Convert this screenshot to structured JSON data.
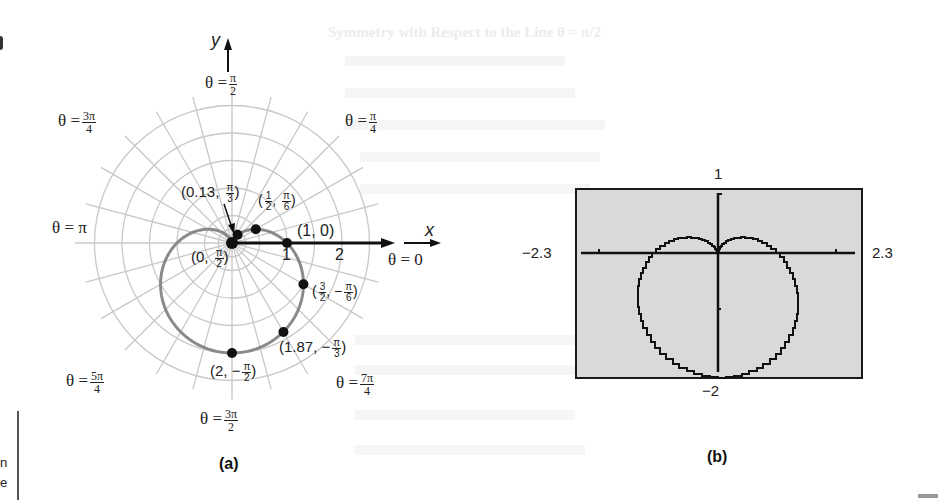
{
  "chart_data": [
    {
      "id": "a",
      "type": "line",
      "subtype": "polar",
      "title": "",
      "caption": "(a)",
      "equation": "r = 1 - sin(theta)",
      "axes": {
        "x_label": "x",
        "y_label": "y",
        "polar_axis_ticks": [
          "1",
          "2"
        ]
      },
      "angle_labels": [
        {
          "theta": "0",
          "text": "θ = 0"
        },
        {
          "theta": "π/4",
          "text": "θ = π/4"
        },
        {
          "theta": "π/2",
          "text": "θ = π/2"
        },
        {
          "theta": "3π/4",
          "text": "θ = 3π/4"
        },
        {
          "theta": "π",
          "text": "θ = π"
        },
        {
          "theta": "5π/4",
          "text": "θ = 5π/4"
        },
        {
          "theta": "3π/2",
          "text": "θ = 3π/2"
        },
        {
          "theta": "7π/4",
          "text": "θ = 7π/4"
        }
      ],
      "points": [
        {
          "r": 0,
          "theta": "π/2",
          "label": "(0, π/2)"
        },
        {
          "r": 0.13,
          "theta": "π/3",
          "label": "(0.13, π/3)"
        },
        {
          "r": 0.5,
          "theta": "π/6",
          "label": "(1/2, π/6)"
        },
        {
          "r": 1,
          "theta": "0",
          "label": "(1, 0)"
        },
        {
          "r": 1.5,
          "theta": "-π/6",
          "label": "(3/2, -π/6)"
        },
        {
          "r": 1.87,
          "theta": "-π/3",
          "label": "(1.87, -π/3)"
        },
        {
          "r": 2,
          "theta": "-π/2",
          "label": "(2, -π/2)"
        }
      ],
      "grid": {
        "polar": true,
        "radial_step_rad": "π/12"
      }
    },
    {
      "id": "b",
      "type": "line",
      "subtype": "graphing-calculator",
      "caption": "(b)",
      "equation": "r = 1 - sin(theta)",
      "xlim": [
        -2.3,
        2.3
      ],
      "ylim": [
        -2,
        1
      ],
      "tick_labels": {
        "left": "−2.3",
        "right": "2.3",
        "top": "1",
        "bottom": "−2"
      },
      "grid": false
    }
  ],
  "figure_a": {
    "y_axis_label": "y",
    "x_axis_label": "x",
    "tick_1": "1",
    "tick_2": "2",
    "caption": "(a)",
    "labels": {
      "theta_0": "θ = 0",
      "theta_pi": "θ = π",
      "theta_prefix": "θ ="
    },
    "fractions": {
      "pi_over_2": {
        "num": "π",
        "den": "2"
      },
      "pi_over_4": {
        "num": "π",
        "den": "4"
      },
      "three_pi_over_4": {
        "num": "3π",
        "den": "4"
      },
      "five_pi_over_4": {
        "num": "5π",
        "den": "4"
      },
      "three_pi_over_2": {
        "num": "3π",
        "den": "2"
      },
      "seven_pi_over_4": {
        "num": "7π",
        "den": "4"
      }
    },
    "point_labels": {
      "p013": {
        "pre": "(0.13, ",
        "num": "π",
        "den": "3",
        "post": ")"
      },
      "phalf": {
        "pre": "(",
        "n1": "1",
        "d1": "2",
        "mid": ", ",
        "num": "π",
        "den": "6",
        "post": ")"
      },
      "p10": "(1, 0)",
      "p0": {
        "pre": "(0, ",
        "num": "π",
        "den": "2",
        "post": ")"
      },
      "p32": {
        "pre": "(",
        "n1": "3",
        "d1": "2",
        "mid": ", −",
        "num": "π",
        "den": "6",
        "post": ")"
      },
      "p187": {
        "pre": "(1.87, −",
        "num": "π",
        "den": "3",
        "post": ")"
      },
      "p2": {
        "pre": "(2, −",
        "num": "π",
        "den": "2",
        "post": ")"
      }
    }
  },
  "figure_b": {
    "caption": "(b)",
    "left": "−2.3",
    "right": "2.3",
    "top": "1",
    "bottom": "−2"
  },
  "background_text": {
    "heading": "Symmetry with Respect to the Line θ = π/2",
    "margin_fragments": [
      "n",
      "e"
    ]
  },
  "colors": {
    "curve_a": "#8a8a8a",
    "grid": "#c8c8c8",
    "axis": "#111111",
    "calculator_screen": "#d9d9d9",
    "calculator_border": "#1a1a1a"
  }
}
